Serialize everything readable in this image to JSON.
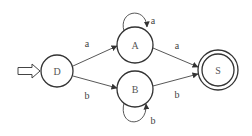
{
  "diagram": {
    "type": "finite-automaton",
    "start_state": "D",
    "accept_states": [
      "S"
    ],
    "nodes": [
      {
        "id": "D",
        "label": "D",
        "cx": 57,
        "cy": 71,
        "r": 16,
        "accepting": false
      },
      {
        "id": "A",
        "label": "A",
        "cx": 135,
        "cy": 45,
        "r": 18,
        "accepting": false
      },
      {
        "id": "B",
        "label": "B",
        "cx": 135,
        "cy": 89,
        "r": 18,
        "accepting": false
      },
      {
        "id": "S",
        "label": "S",
        "cx": 218,
        "cy": 70,
        "r": 20,
        "accepting": true
      }
    ],
    "edges": [
      {
        "from": "D",
        "to": "A",
        "label": "a"
      },
      {
        "from": "D",
        "to": "B",
        "label": "b"
      },
      {
        "from": "A",
        "to": "A",
        "label": "a"
      },
      {
        "from": "B",
        "to": "B",
        "label": "b"
      },
      {
        "from": "A",
        "to": "S",
        "label": "a"
      },
      {
        "from": "B",
        "to": "S",
        "label": "b"
      }
    ],
    "labels": {
      "D": "D",
      "A": "A",
      "B": "B",
      "S": "S",
      "edge_DA": "a",
      "edge_DB": "b",
      "edge_AA": "a",
      "edge_BB": "b",
      "edge_AS": "a",
      "edge_BS": "b"
    },
    "colors": {
      "stroke": "#333333",
      "text": "#555555",
      "background": "#ffffff"
    }
  }
}
